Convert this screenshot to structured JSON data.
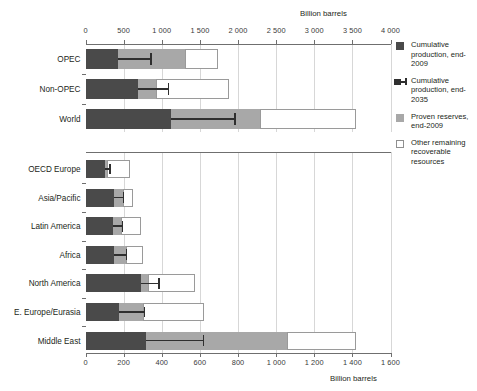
{
  "units": {
    "top_label": "Billion barrels",
    "bottom_label": "Billion barrels"
  },
  "legend": {
    "items": [
      {
        "key": "cum-prod-2009",
        "swatch": "dark-square",
        "label": "Cumulative production, end-2009"
      },
      {
        "key": "cum-prod-2035",
        "swatch": "dark-square-with-errorbar",
        "label": "Cumulative production, end-2035"
      },
      {
        "key": "proven-reserves-2009",
        "swatch": "gray-square",
        "label": "Proven reserves, end-2009"
      },
      {
        "key": "other-remaining",
        "swatch": "white-square",
        "label": "Other remaining recoverable resources"
      }
    ]
  },
  "chart_data": [
    {
      "id": "top-chart",
      "type": "bar",
      "orientation": "horizontal",
      "stacked": true,
      "title": "",
      "xlabel": "Billion barrels",
      "ylabel": "",
      "xlim": [
        0,
        4000
      ],
      "xticks": [
        0,
        500,
        1000,
        1500,
        2000,
        2500,
        3000,
        3500,
        4000
      ],
      "xtick_labels": [
        "0",
        "500",
        "1 000",
        "1 500",
        "2 000",
        "2 500",
        "3 000",
        "3 500",
        "4 000"
      ],
      "grid": true,
      "categories": [
        "OPEC",
        "Non-OPEC",
        "World"
      ],
      "series": [
        {
          "name": "Cumulative production, end-2009",
          "color": "#4a4a4a",
          "values": [
            430,
            690,
            1120
          ]
        },
        {
          "name": "Proven reserves, end-2009",
          "color": "#a8a8a8",
          "values": [
            880,
            230,
            1170
          ]
        },
        {
          "name": "Other remaining recoverable resources",
          "color": "#ffffff",
          "values": [
            430,
            960,
            1260
          ]
        }
      ],
      "error_bars": [
        {
          "category": "OPEC",
          "value": 860,
          "from": 430
        },
        {
          "category": "Non-OPEC",
          "value": 1090,
          "from": 690
        },
        {
          "category": "World",
          "value": 1960,
          "from": 1120
        }
      ]
    },
    {
      "id": "bottom-chart",
      "type": "bar",
      "orientation": "horizontal",
      "stacked": true,
      "title": "",
      "xlabel": "Billion barrels",
      "ylabel": "",
      "xlim": [
        0,
        1600
      ],
      "xticks": [
        0,
        200,
        400,
        600,
        800,
        1000,
        1200,
        1400,
        1600
      ],
      "xtick_labels": [
        "0",
        "200",
        "400",
        "600",
        "800",
        "1 000",
        "1 200",
        "1 400",
        "1 600"
      ],
      "grid": true,
      "categories": [
        "OECD Europe",
        "Asia/Pacific",
        "Latin America",
        "Africa",
        "North America",
        "E. Europe/Eurasia",
        "Middle East"
      ],
      "series": [
        {
          "name": "Cumulative production, end-2009",
          "color": "#4a4a4a",
          "values": [
            100,
            150,
            145,
            150,
            290,
            175,
            315
          ]
        },
        {
          "name": "Proven reserves, end-2009",
          "color": "#a8a8a8",
          "values": [
            15,
            45,
            40,
            65,
            40,
            125,
            740
          ]
        },
        {
          "name": "Other remaining recoverable resources",
          "color": "#ffffff",
          "values": [
            120,
            55,
            105,
            85,
            245,
            320,
            365
          ]
        }
      ],
      "error_bars": [
        {
          "category": "OECD Europe",
          "value": 130,
          "from": 100
        },
        {
          "category": "Asia/Pacific",
          "value": 200,
          "from": 150
        },
        {
          "category": "Latin America",
          "value": 195,
          "from": 145
        },
        {
          "category": "Africa",
          "value": 215,
          "from": 150
        },
        {
          "category": "North America",
          "value": 385,
          "from": 290
        },
        {
          "category": "E. Europe/Eurasia",
          "value": 310,
          "from": 175
        },
        {
          "category": "Middle East",
          "value": 620,
          "from": 315
        }
      ]
    }
  ]
}
